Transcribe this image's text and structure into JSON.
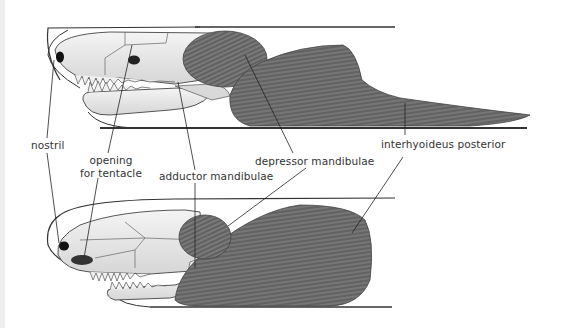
{
  "figure": {
    "views": [
      {
        "name": "upper-view",
        "description": "lateral view, mouth open"
      },
      {
        "name": "lower-view",
        "description": "lateral view, mouth slightly open"
      }
    ]
  },
  "labels": {
    "nostril": "nostril",
    "opening_line1": "opening",
    "opening_line2": "for tentacle",
    "adductor": "adductor mandibulae",
    "depressor": "depressor mandibulae",
    "interhyoideus": "interhyoideus posterior"
  },
  "colors": {
    "muscle": "#6a6a6a",
    "muscle_dark": "#4a4a4a",
    "bone": "#eeeeee",
    "outline": "#333333",
    "leader": "#222222",
    "text": "#333333"
  }
}
